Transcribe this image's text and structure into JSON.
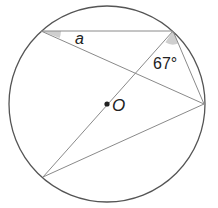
{
  "diagram": {
    "type": "circle-theorem",
    "center_label": "O",
    "angle_unknown_label": "a",
    "angle_given_label": "67°",
    "colors": {
      "circle": "#555555",
      "lines": "#8a8a8a",
      "shade": "#cfcfcf",
      "text": "#222222"
    },
    "points": {
      "A": [
        41,
        31
      ],
      "B": [
        173,
        31
      ],
      "C": [
        204,
        104
      ],
      "D": [
        43,
        177
      ],
      "O": [
        107,
        104
      ]
    },
    "segments": [
      "A-B",
      "A-C",
      "B-C",
      "B-D",
      "D-C"
    ]
  }
}
